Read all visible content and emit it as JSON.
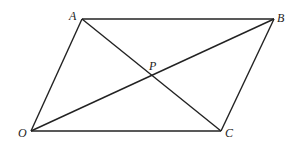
{
  "diagram": {
    "type": "parallelogram",
    "points": {
      "A": {
        "label": "A",
        "x": 82,
        "y": 19
      },
      "B": {
        "label": "B",
        "x": 274,
        "y": 19
      },
      "C": {
        "label": "C",
        "x": 221,
        "y": 131
      },
      "O": {
        "label": "O",
        "x": 31,
        "y": 131
      },
      "P": {
        "label": "P",
        "x": 152,
        "y": 75
      }
    },
    "edges": [
      [
        "O",
        "A"
      ],
      [
        "A",
        "B"
      ],
      [
        "B",
        "C"
      ],
      [
        "C",
        "O"
      ],
      [
        "O",
        "B"
      ],
      [
        "A",
        "C"
      ]
    ],
    "stroke_color": "#222222"
  }
}
